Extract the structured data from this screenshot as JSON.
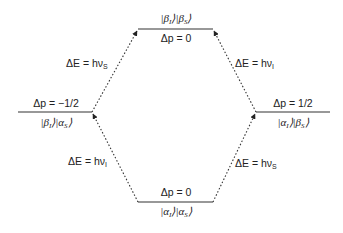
{
  "diagram": {
    "type": "energy-level-diagram",
    "colors": {
      "line": "#222222",
      "text": "#222222",
      "background": "#ffffff"
    },
    "levels": [
      {
        "id": "top",
        "state_a": "β",
        "sub_a": "I",
        "state_b": "β",
        "sub_b": "S",
        "delta_p": "Δp = 0"
      },
      {
        "id": "left",
        "state_a": "β",
        "sub_a": "I",
        "state_b": "α",
        "sub_b": "S",
        "delta_p": "Δp = −1/2"
      },
      {
        "id": "right",
        "state_a": "α",
        "sub_a": "I",
        "state_b": "β",
        "sub_b": "S",
        "delta_p": "Δp = 1/2"
      },
      {
        "id": "bottom",
        "state_a": "α",
        "sub_a": "I",
        "state_b": "α",
        "sub_b": "S",
        "delta_p": "Δp = 0"
      }
    ],
    "transitions": [
      {
        "id": "left-upper",
        "from": "left",
        "to": "top",
        "label_prefix": "ΔE = hν",
        "label_sub": "S"
      },
      {
        "id": "right-upper",
        "from": "right",
        "to": "top",
        "label_prefix": "ΔE = hν",
        "label_sub": "I"
      },
      {
        "id": "left-lower",
        "from": "bottom",
        "to": "left",
        "label_prefix": "ΔE = hν",
        "label_sub": "I"
      },
      {
        "id": "right-lower",
        "from": "bottom",
        "to": "right",
        "label_prefix": "ΔE = hν",
        "label_sub": "S"
      }
    ]
  }
}
